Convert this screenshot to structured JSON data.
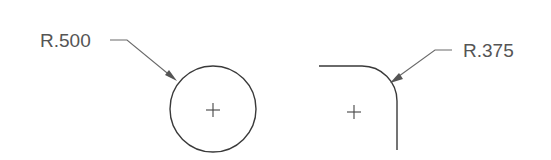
{
  "diagram": {
    "type": "engineering-drawing-radius-dimensions",
    "colors": {
      "background": "#ffffff",
      "geometry": "#3a3a3a",
      "leader": "#6a6a6a",
      "text": "#555555"
    },
    "features": [
      {
        "id": "circle",
        "shape": "full circle with center mark",
        "dimension_label": "R.500",
        "center": [
          213,
          109
        ],
        "radius_px": 43
      },
      {
        "id": "fillet",
        "shape": "rounded corner (fillet) with center mark",
        "dimension_label": "R.375",
        "center": [
          362,
          101
        ],
        "radius_px": 35
      }
    ]
  }
}
